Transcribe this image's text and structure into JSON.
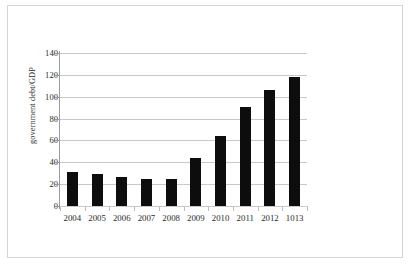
{
  "chart_data": {
    "type": "bar",
    "title": "",
    "subtitle": "",
    "xlabel": "",
    "ylabel": "government debt/GDP",
    "categories": [
      "2004",
      "2005",
      "2006",
      "2007",
      "2008",
      "2009",
      "2010",
      "2011",
      "2012",
      "1013"
    ],
    "values": [
      31,
      29,
      27,
      25,
      25,
      44,
      64,
      91,
      106,
      118
    ],
    "series": [
      {
        "name": "government debt/GDP",
        "values": [
          31,
          29,
          27,
          25,
          25,
          44,
          64,
          91,
          106,
          118
        ]
      }
    ],
    "ylim": [
      0,
      140
    ],
    "ytick_labels": [
      "0",
      "20",
      "40",
      "60",
      "80",
      "100",
      "120",
      "140"
    ],
    "ytick_values": [
      0,
      20,
      40,
      60,
      80,
      100,
      120,
      140
    ],
    "grid": "horizontal",
    "legend": "none",
    "bar_color": "#0d0d0d",
    "gridline_color": "#c8c8c8",
    "axis_color": "#9a9a9a",
    "text_color": "#2b2b2b",
    "background_color": "#ffffff",
    "border_color": "#d4d4d4"
  }
}
